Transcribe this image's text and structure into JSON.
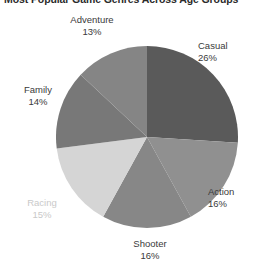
{
  "chart_data": {
    "type": "pie",
    "title": "Most Popular Game Genres Across Age Groups",
    "title_truncated": true,
    "categories": [
      "Casual",
      "Action",
      "Shooter",
      "Racing",
      "Family",
      "Adventure"
    ],
    "values": [
      26,
      16,
      16,
      15,
      14,
      13
    ],
    "value_labels": [
      "26%",
      "16%",
      "16%",
      "15%",
      "14%",
      "13%"
    ],
    "unit": "%",
    "start_angle_deg": 0,
    "direction": "clockwise",
    "legend": "labels-outside-slices",
    "grid": false,
    "xlabel": "",
    "ylabel": "",
    "colors": [
      "#5a5a5a",
      "#909090",
      "#878787",
      "#d5d5d5",
      "#787878",
      "#858585"
    ],
    "label_colors": [
      "#3a3a3a",
      "#3a3a3a",
      "#3a3a3a",
      "#c9c9c9",
      "#3a3a3a",
      "#3a3a3a"
    ],
    "background": "#ffffff"
  },
  "labels": {
    "casual": {
      "name": "Casual",
      "pct": "26%"
    },
    "action": {
      "name": "Action",
      "pct": "16%"
    },
    "shooter": {
      "name": "Shooter",
      "pct": "16%"
    },
    "racing": {
      "name": "Racing",
      "pct": "15%"
    },
    "family": {
      "name": "Family",
      "pct": "14%"
    },
    "adventure": {
      "name": "Adventure",
      "pct": "13%"
    }
  }
}
